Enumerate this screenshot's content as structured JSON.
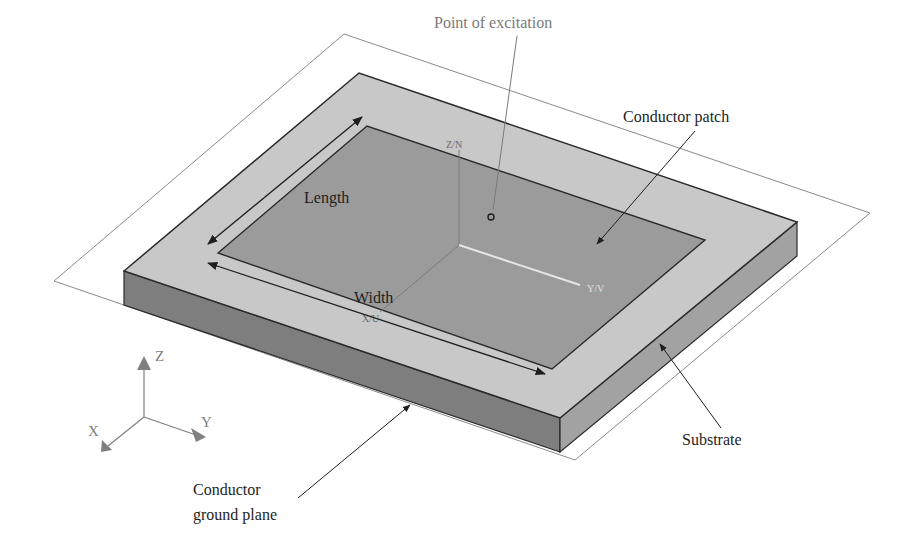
{
  "diagram": {
    "colors": {
      "background": "#ffffff",
      "ground_plane_outline": "#8a8a8a",
      "substrate_top": "#c8c8c8",
      "substrate_front": "#7e7e7e",
      "substrate_right": "#a2a2a2",
      "patch": "#9b9b9b",
      "edge": "#2a2a2a",
      "label_dark": "#1e1e1e",
      "label_gray": "#7a7a7a",
      "axis_gray": "#808080",
      "local_y_axis": "#e6e6e6"
    },
    "labels": {
      "point_of_excitation": "Point of excitation",
      "conductor_patch": "Conductor patch",
      "length": "Length",
      "width": "Width",
      "substrate": "Substrate",
      "ground_plane_line1": "Conductor",
      "ground_plane_line2": "ground plane"
    },
    "axis_triad": {
      "z": "Z",
      "x": "X",
      "y": "Y"
    },
    "model_axes": {
      "z": "Z/N",
      "y": "Y/V",
      "x": "X/U"
    }
  }
}
